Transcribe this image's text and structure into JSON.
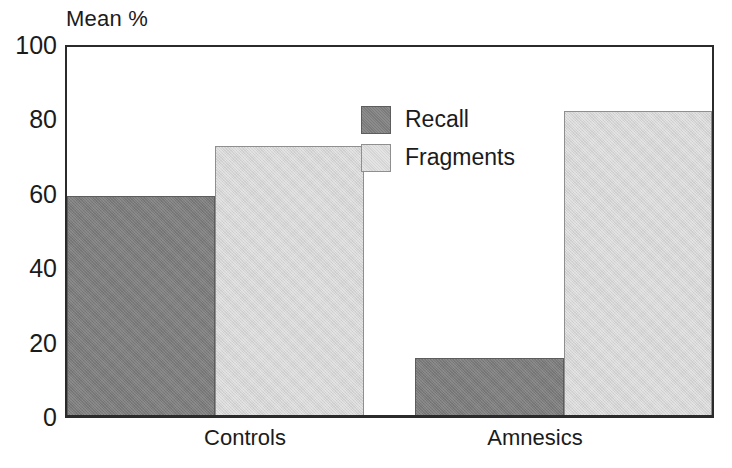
{
  "chart_data": {
    "type": "bar",
    "title": "",
    "axis_title": "Mean %",
    "xlabel": "",
    "ylabel": "Mean %",
    "ylim": [
      0,
      100
    ],
    "yticks": [
      100,
      80,
      60,
      40,
      20,
      0
    ],
    "ytick_labels": [
      "100",
      "80",
      "60",
      "40",
      "20",
      "0"
    ],
    "grid": false,
    "legend_position": "inside-top-center",
    "categories": [
      "Controls",
      "Amnesics"
    ],
    "series": [
      {
        "name": "Recall",
        "color": "#7b7b7b",
        "values": [
          59.5,
          15.5
        ]
      },
      {
        "name": "Fragments",
        "color": "#d5d5d5",
        "values": [
          73,
          82.5
        ]
      }
    ],
    "legend": [
      {
        "label": "Recall",
        "swatch": "dark"
      },
      {
        "label": "Fragments",
        "swatch": "light"
      }
    ],
    "annotations": []
  },
  "colors": {
    "recall": "#7b7b7b",
    "fragments": "#d5d5d5",
    "axis": "#2b2b2b",
    "text": "#1b1b1b",
    "background": "#ffffff"
  }
}
